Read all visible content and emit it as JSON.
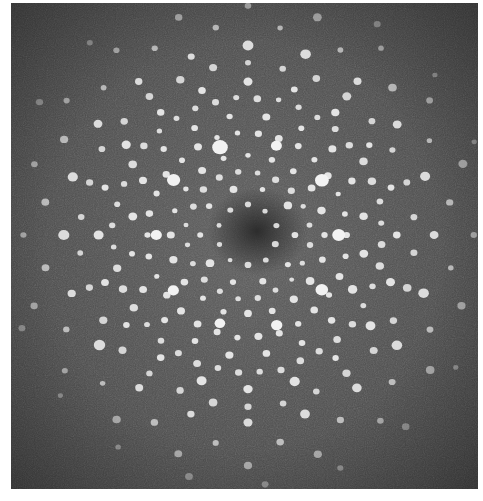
{
  "image": {
    "description": "Electron diffraction pattern showing ten-fold (decagonal) symmetry of a quasicrystal",
    "background_color": "#4a4a4a",
    "center_dark_color": "#2c2c2c",
    "spot_color": "#f2f2f2",
    "center": [
      237,
      232
    ],
    "symmetry_fold": 10,
    "rings": [
      {
        "r": 30,
        "n": 10,
        "size": 2.6,
        "offset": 0,
        "opacity": 0.85
      },
      {
        "r": 48,
        "n": 10,
        "size": 3.0,
        "offset": 18,
        "opacity": 0.9
      },
      {
        "r": 62,
        "n": 20,
        "size": 2.6,
        "offset": 9,
        "opacity": 0.85
      },
      {
        "r": 78,
        "n": 20,
        "size": 3.0,
        "offset": 0,
        "opacity": 0.9
      },
      {
        "r": 92,
        "n": 10,
        "size": 6.0,
        "offset": 18,
        "opacity": 1.0
      },
      {
        "r": 100,
        "n": 30,
        "size": 2.8,
        "offset": 6,
        "opacity": 0.9
      },
      {
        "r": 118,
        "n": 20,
        "size": 3.4,
        "offset": 9,
        "opacity": 0.9
      },
      {
        "r": 135,
        "n": 40,
        "size": 3.0,
        "offset": 4,
        "opacity": 0.85
      },
      {
        "r": 150,
        "n": 20,
        "size": 3.6,
        "offset": 0,
        "opacity": 0.9
      },
      {
        "r": 168,
        "n": 30,
        "size": 3.2,
        "offset": 12,
        "opacity": 0.8
      },
      {
        "r": 185,
        "n": 20,
        "size": 4.0,
        "offset": 18,
        "opacity": 0.85
      },
      {
        "r": 205,
        "n": 20,
        "size": 3.0,
        "offset": 9,
        "opacity": 0.65
      },
      {
        "r": 225,
        "n": 20,
        "size": 3.2,
        "offset": 0,
        "opacity": 0.55
      },
      {
        "r": 245,
        "n": 20,
        "size": 2.8,
        "offset": 14,
        "opacity": 0.4
      }
    ]
  }
}
